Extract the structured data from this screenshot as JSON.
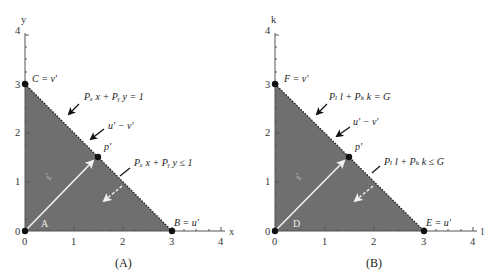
{
  "figure": {
    "panels": [
      {
        "id": "A",
        "caption": "(A)",
        "x_axis_label": "x",
        "y_axis_label": "y",
        "x_ticks": [
          "0",
          "1",
          "2",
          "3",
          "4"
        ],
        "y_ticks": [
          "0",
          "1",
          "2",
          "3",
          "4"
        ],
        "points": {
          "top": {
            "label": "C = v'",
            "x": 0,
            "y": 3
          },
          "right": {
            "label": "B = u'",
            "x": 3,
            "y": 0
          },
          "origin": {
            "label": "A",
            "x": 0,
            "y": 0
          },
          "mid": {
            "label": "p'",
            "x": 1.5,
            "y": 1.5
          }
        },
        "vector_label": "z'",
        "annotations": {
          "line_eq": "Pₓ x + Pᵧ y = 1",
          "segment": "u' − v'",
          "region": "Pₓ x + Pᵧ y ≤ 1"
        }
      },
      {
        "id": "B",
        "caption": "(B)",
        "x_axis_label": "l",
        "y_axis_label": "k",
        "x_ticks": [
          "0",
          "1",
          "2",
          "3",
          "4"
        ],
        "y_ticks": [
          "0",
          "1",
          "2",
          "3",
          "4"
        ],
        "points": {
          "top": {
            "label": "F = v'",
            "x": 0,
            "y": 3
          },
          "right": {
            "label": "E = u'",
            "x": 3,
            "y": 0
          },
          "origin": {
            "label": "D",
            "x": 0,
            "y": 0
          },
          "mid": {
            "label": "p'",
            "x": 1.5,
            "y": 1.5
          }
        },
        "vector_label": "z'",
        "annotations": {
          "line_eq": "Pₗ l + Pₖ k = G",
          "segment": "u' − v'",
          "region": "Pₗ l + Pₖ k ≤ G"
        }
      }
    ],
    "colors": {
      "fill": "#6f6f6f",
      "axis": "#555555",
      "vector": "#f2f2f2",
      "point": "#111111"
    }
  }
}
